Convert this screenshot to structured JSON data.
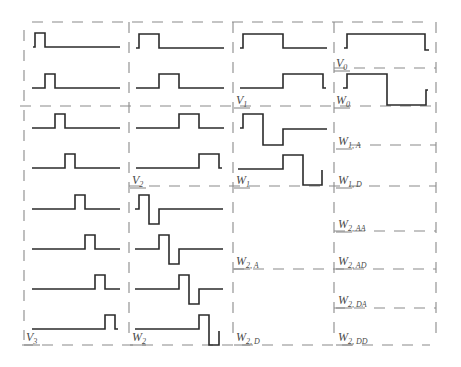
{
  "diagram": {
    "labels": [
      {
        "id": "V0",
        "main": "V",
        "sub": "0",
        "x": 336,
        "y": 67
      },
      {
        "id": "W0",
        "main": "W",
        "sub": "0",
        "x": 336,
        "y": 104
      },
      {
        "id": "V1",
        "main": "V",
        "sub": "1",
        "x": 236,
        "y": 104
      },
      {
        "id": "W1A",
        "main": "W",
        "sub": "1, A",
        "x": 338,
        "y": 145
      },
      {
        "id": "W1",
        "main": "W",
        "sub": "1",
        "x": 236,
        "y": 184
      },
      {
        "id": "W1D",
        "main": "W",
        "sub": "1, D",
        "x": 338,
        "y": 184
      },
      {
        "id": "V2",
        "main": "V",
        "sub": "2",
        "x": 132,
        "y": 184
      },
      {
        "id": "W2AA",
        "main": "W",
        "sub": "2, AA",
        "x": 338,
        "y": 228
      },
      {
        "id": "W2A",
        "main": "W",
        "sub": "2, A",
        "x": 236,
        "y": 265
      },
      {
        "id": "W2AD",
        "main": "W",
        "sub": "2, AD",
        "x": 338,
        "y": 265
      },
      {
        "id": "W2DA",
        "main": "W",
        "sub": "2, DA",
        "x": 338,
        "y": 304
      },
      {
        "id": "V3",
        "main": "V",
        "sub": "3",
        "x": 26,
        "y": 341
      },
      {
        "id": "W2",
        "main": "W",
        "sub": "2",
        "x": 132,
        "y": 341
      },
      {
        "id": "W2D",
        "main": "W",
        "sub": "2, D",
        "x": 236,
        "y": 341
      },
      {
        "id": "W2DD",
        "main": "W",
        "sub": "2, DD",
        "x": 338,
        "y": 341
      }
    ],
    "waveforms": [
      {
        "name": "v3-basis-0",
        "points": "33,47 35,47 35,33 45,33 45,47 120,47"
      },
      {
        "name": "v3-basis-1",
        "points": "32,88 45,88 45,74 55,74 55,88 120,88"
      },
      {
        "name": "v3-basis-2",
        "points": "32,128 55,128 55,114 65,114 65,128 120,128"
      },
      {
        "name": "v3-basis-3",
        "points": "32,168 65,168 65,154 75,154 75,168 120,168"
      },
      {
        "name": "v3-basis-4",
        "points": "32,209 75,209 75,195 85,195 85,209 120,209"
      },
      {
        "name": "v3-basis-5",
        "points": "32,249 85,249 85,235 95,235 95,249 120,249"
      },
      {
        "name": "v3-basis-6",
        "points": "32,289 95,289 95,275 105,275 105,289 120,289"
      },
      {
        "name": "v3-basis-7",
        "points": "32,329 105,329 105,315 115,315 115,329 118,329"
      },
      {
        "name": "v2-basis-0",
        "points": "136,48 139,48 139,34 159,34 159,48 224,48"
      },
      {
        "name": "v2-basis-1",
        "points": "136,88 159,88 159,74 179,74 179,88 224,88"
      },
      {
        "name": "v2-basis-2",
        "points": "136,128 179,128 179,114 199,114 199,128 224,128"
      },
      {
        "name": "v2-basis-3",
        "points": "136,168 199,168 199,154 219,154 219,168 222,168"
      },
      {
        "name": "w2-basis-0",
        "points": "135,209 139,209 139,195 149,195 149,224 159,224 159,209 223,209"
      },
      {
        "name": "w2-basis-1",
        "points": "135,249 159,249 159,235 169,235 169,264 179,264 179,249 223,249"
      },
      {
        "name": "w2-basis-2",
        "points": "135,289 179,289 179,275 189,275 189,304 199,304 199,289 223,289"
      },
      {
        "name": "w2-basis-3",
        "points": "135,329 199,329 199,315 209,315 209,345 219,345 219,331"
      },
      {
        "name": "v1-basis-0",
        "points": "240,48 243,48 243,34 283,34 283,48 327,48"
      },
      {
        "name": "v1-basis-1",
        "points": "240,88 283,88 283,74 323,74 323,88 326,88"
      },
      {
        "name": "w1-basis-0",
        "points": "240,128 243,128 243,114 263,114 263,145 283,145 283,129 327,129"
      },
      {
        "name": "w1-basis-1",
        "points": "238,169 283,169 283,155 303,155 303,185 322,185 322,170"
      },
      {
        "name": "v0-basis",
        "points": "344,48 347,48 347,34 425,34 425,50 429,50"
      },
      {
        "name": "w0-basis",
        "points": "343,88 347,88 347,74 387,74 387,105 426,105 426,90 428,90"
      }
    ],
    "dashed_lines": [
      {
        "name": "top-border",
        "d": "M32,22 L430,22"
      },
      {
        "name": "v0-bottom",
        "d": "M334,68 L436,68"
      },
      {
        "name": "v1-w0-bottom",
        "d": "M20,106 L436,106"
      },
      {
        "name": "w1a-bottom",
        "d": "M350,145 L436,145"
      },
      {
        "name": "v2-w1-bottom",
        "d": "M129,186 L436,186"
      },
      {
        "name": "w2aa-bottom",
        "d": "M334,231 L436,231"
      },
      {
        "name": "w2a-ad-bottom",
        "d": "M233,269 L436,269"
      },
      {
        "name": "w2da-bottom",
        "d": "M334,308 L436,308"
      },
      {
        "name": "bottom-border",
        "d": "M22,345 L430,345"
      },
      {
        "name": "col1-left",
        "d": "M24,30 L24,340"
      },
      {
        "name": "col2-left",
        "d": "M129,22 L129,340"
      },
      {
        "name": "col3-left",
        "d": "M233,22 L233,340"
      },
      {
        "name": "col4-left",
        "d": "M334,22 L334,340"
      },
      {
        "name": "col5-right",
        "d": "M436,22 L436,340"
      }
    ]
  }
}
